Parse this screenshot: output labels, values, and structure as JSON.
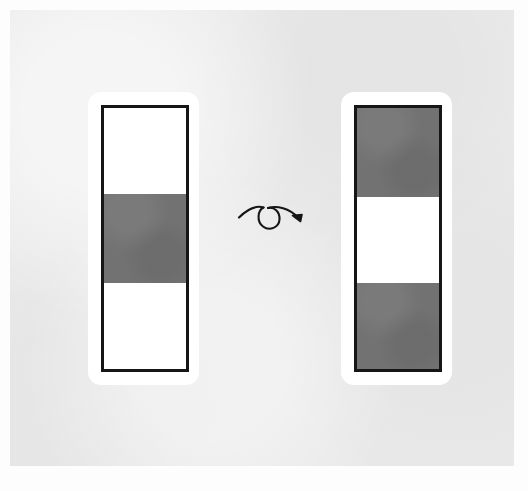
{
  "figure": {
    "background_color": "#e9e9e9",
    "page_color": "#fdfdfd",
    "band_gray_color": "#727272",
    "band_white_color": "#ffffff",
    "frame_color": "#161616",
    "card_color": "#ffffff",
    "arrow_color": "#161616"
  },
  "panels": [
    {
      "id": "left",
      "name": "source-pattern",
      "role": "input",
      "position": {
        "x": 88,
        "y": 92,
        "width": 111,
        "height": 293
      },
      "bands": [
        {
          "index": 0,
          "color_name": "white",
          "color": "#ffffff",
          "fraction": 0.33
        },
        {
          "index": 1,
          "color_name": "gray",
          "color": "#727272",
          "fraction": 0.34
        },
        {
          "index": 2,
          "color_name": "white",
          "color": "#ffffff",
          "fraction": 0.33
        }
      ]
    },
    {
      "id": "right",
      "name": "result-pattern",
      "role": "output",
      "position": {
        "x": 341,
        "y": 92,
        "width": 111,
        "height": 293
      },
      "bands": [
        {
          "index": 0,
          "color_name": "gray",
          "color": "#727272",
          "fraction": 0.34
        },
        {
          "index": 1,
          "color_name": "white",
          "color": "#ffffff",
          "fraction": 0.33
        },
        {
          "index": 2,
          "color_name": "gray",
          "color": "#727272",
          "fraction": 0.33
        }
      ]
    }
  ],
  "arrow": {
    "name": "loop-arrow",
    "icon": "curved-loop-arrow-right-icon",
    "direction": "left-to-right",
    "has_loop": true,
    "position": {
      "x": 236,
      "y": 196,
      "width": 76,
      "height": 44
    }
  }
}
